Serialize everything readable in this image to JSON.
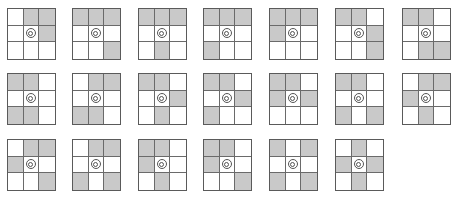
{
  "diagram": {
    "colors": {
      "shaded": "#c9c9c9",
      "border": "#5a5a5a",
      "background": "#ffffff",
      "marker": "#555555"
    },
    "cell_index_order": "row-major: 0=top-left,1=top-mid,2=top-right,3=mid-left,4=center,5=mid-right,6=bot-left,7=bot-mid,8=bot-right",
    "center_marker": "double-ring-icon",
    "grids": [
      {
        "row": 0,
        "col": 0,
        "shaded": [
          1,
          2,
          5
        ]
      },
      {
        "row": 0,
        "col": 1,
        "shaded": [
          0,
          1,
          2,
          8
        ]
      },
      {
        "row": 0,
        "col": 2,
        "shaded": [
          0,
          1,
          2,
          7
        ]
      },
      {
        "row": 0,
        "col": 3,
        "shaded": [
          0,
          1,
          2,
          6
        ]
      },
      {
        "row": 0,
        "col": 4,
        "shaded": [
          0,
          1,
          2,
          3
        ]
      },
      {
        "row": 0,
        "col": 5,
        "shaded": [
          0,
          1,
          5,
          8
        ]
      },
      {
        "row": 0,
        "col": 6,
        "shaded": [
          0,
          1,
          7,
          8
        ]
      },
      {
        "row": 1,
        "col": 0,
        "shaded": [
          0,
          1,
          6,
          7
        ]
      },
      {
        "row": 1,
        "col": 1,
        "shaded": [
          1,
          2,
          6,
          7
        ]
      },
      {
        "row": 1,
        "col": 2,
        "shaded": [
          0,
          1,
          5,
          7
        ]
      },
      {
        "row": 1,
        "col": 3,
        "shaded": [
          0,
          1,
          5,
          6
        ]
      },
      {
        "row": 1,
        "col": 4,
        "shaded": [
          0,
          1,
          3,
          5
        ]
      },
      {
        "row": 1,
        "col": 5,
        "shaded": [
          0,
          1,
          6,
          8
        ]
      },
      {
        "row": 1,
        "col": 6,
        "shaded": [
          1,
          2,
          3,
          7
        ]
      },
      {
        "row": 2,
        "col": 0,
        "shaded": [
          1,
          2,
          3,
          8
        ]
      },
      {
        "row": 2,
        "col": 1,
        "shaded": [
          1,
          2,
          6,
          8
        ]
      },
      {
        "row": 2,
        "col": 2,
        "shaded": [
          0,
          1,
          3,
          7
        ]
      },
      {
        "row": 2,
        "col": 3,
        "shaded": [
          0,
          1,
          3,
          8
        ]
      },
      {
        "row": 2,
        "col": 4,
        "shaded": [
          0,
          2,
          6,
          8
        ]
      },
      {
        "row": 2,
        "col": 5,
        "shaded": [
          1,
          3,
          5,
          7
        ]
      }
    ]
  }
}
